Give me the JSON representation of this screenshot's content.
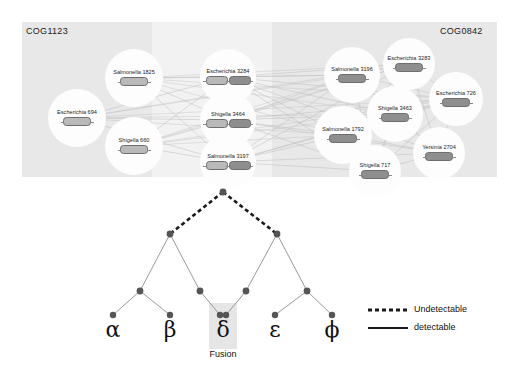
{
  "figure": {
    "network": {
      "left_cog_label": "COG1123",
      "right_cog_label": "COG0842",
      "left_nodes": [
        {
          "label": "Salmonella 1825",
          "cx": 112,
          "cy": 56,
          "r": 29,
          "genes": [
            "light"
          ]
        },
        {
          "label": "Escherichia 694",
          "cx": 55,
          "cy": 96,
          "r": 29,
          "genes": [
            "light"
          ]
        },
        {
          "label": "Shigella 660",
          "cx": 112,
          "cy": 124,
          "r": 29,
          "genes": [
            "light"
          ]
        }
      ],
      "middle_nodes": [
        {
          "label": "Escherichia 3284",
          "cx": 206,
          "cy": 55,
          "r": 28,
          "genes": [
            "light",
            "dark"
          ]
        },
        {
          "label": "Shigella 3464",
          "cx": 206,
          "cy": 98,
          "r": 28,
          "genes": [
            "light",
            "dark"
          ]
        },
        {
          "label": "Salmonella 3197",
          "cx": 206,
          "cy": 140,
          "r": 28,
          "genes": [
            "light",
            "dark"
          ]
        }
      ],
      "right_nodes": [
        {
          "label": "Salmonella 3196",
          "cx": 330,
          "cy": 53,
          "r": 28,
          "genes": [
            "dark"
          ]
        },
        {
          "label": "Escherichia 3283",
          "cx": 387,
          "cy": 42,
          "r": 26,
          "genes": [
            "dark"
          ]
        },
        {
          "label": "Escherichia 726",
          "cx": 434,
          "cy": 77,
          "r": 27,
          "genes": [
            "dark"
          ]
        },
        {
          "label": "Shigella 3463",
          "cx": 373,
          "cy": 92,
          "r": 28,
          "genes": [
            "dark"
          ]
        },
        {
          "label": "Salmonella 1792",
          "cx": 321,
          "cy": 113,
          "r": 29,
          "genes": [
            "dark"
          ]
        },
        {
          "label": "Yersinia 2704",
          "cx": 417,
          "cy": 131,
          "r": 26,
          "genes": [
            "dark"
          ]
        },
        {
          "label": "Shigella 717",
          "cx": 353,
          "cy": 149,
          "r": 26,
          "genes": [
            "dark"
          ]
        }
      ]
    },
    "tree": {
      "root": {
        "x": 223,
        "y": 192
      },
      "internal_nodes": [
        {
          "x": 170,
          "y": 234
        },
        {
          "x": 277,
          "y": 234
        },
        {
          "x": 140,
          "y": 291
        },
        {
          "x": 200,
          "y": 291
        },
        {
          "x": 246,
          "y": 291
        },
        {
          "x": 307,
          "y": 291
        }
      ],
      "leaves": [
        {
          "name": "alpha",
          "symbol": "α",
          "x": 113,
          "y": 327
        },
        {
          "name": "beta",
          "symbol": "β",
          "x": 170,
          "y": 327
        },
        {
          "name": "delta",
          "symbol": "δ",
          "x": 223,
          "y": 327
        },
        {
          "name": "epsilon",
          "symbol": "ε",
          "x": 275,
          "y": 327
        },
        {
          "name": "phi",
          "symbol": "ϕ",
          "x": 332,
          "y": 327
        }
      ],
      "fusion_label": "Fusion",
      "legend": [
        {
          "style": "dashed",
          "label": "Undetectable"
        },
        {
          "style": "solid",
          "label": "detectable"
        }
      ]
    },
    "colors": {
      "panel_background": "#eeeeee",
      "band_light": "#f2f2f2",
      "band_dark": "#e8e8e8",
      "node_fill": "#fdfdfd",
      "gene_light": "#b9b9b9",
      "gene_dark": "#8e8e8e",
      "edge": "#bdbdbd",
      "tree_node": "#555555",
      "tree_branch": "#8d8d8d",
      "fusion_highlight": "#e6e6e6"
    }
  }
}
